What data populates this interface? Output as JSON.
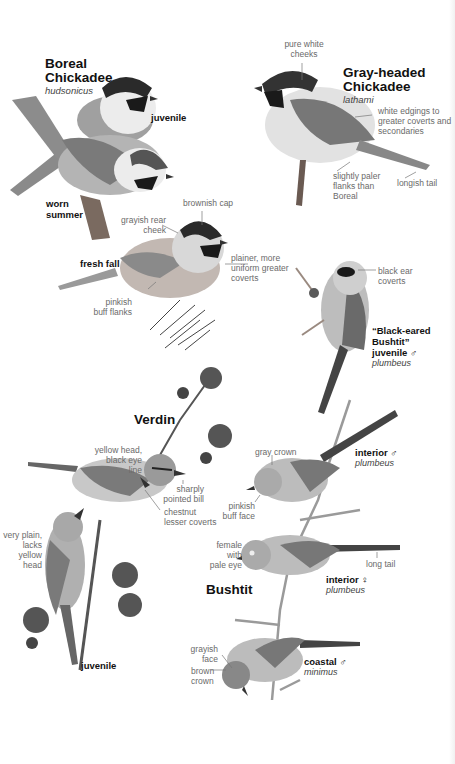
{
  "species": [
    {
      "name": "Boreal Chickadee",
      "name_line1": "Boreal",
      "name_line2": "Chickadee",
      "subspecies": "hudsonicus",
      "forms": {
        "juvenile": "juvenile",
        "worn_summer_1": "worn",
        "worn_summer_2": "summer",
        "fresh_fall": "fresh fall"
      },
      "annotations": {
        "brownish_cap": "brownish cap",
        "grayish_rear_cheek_1": "grayish rear",
        "grayish_rear_cheek_2": "cheek",
        "plainer_1": "plainer, more",
        "plainer_2": "uniform greater",
        "plainer_3": "coverts",
        "pinkish_1": "pinkish",
        "pinkish_2": "buff flanks"
      }
    },
    {
      "name": "Gray-headed Chickadee",
      "name_line1": "Gray-headed",
      "name_line2": "Chickadee",
      "subspecies": "lathami",
      "annotations": {
        "pure_white_1": "pure white",
        "pure_white_2": "cheeks",
        "white_edgings_1": "white edgings to",
        "white_edgings_2": "greater coverts and",
        "white_edgings_3": "secondaries",
        "paler_flanks_1": "slightly paler",
        "paler_flanks_2": "flanks than",
        "paler_flanks_3": "Boreal",
        "longish_tail": "longish tail"
      }
    },
    {
      "name": "Verdin",
      "forms": {
        "juvenile": "juvenile"
      },
      "annotations": {
        "yellow_head_1": "yellow head,",
        "yellow_head_2": "black eye line",
        "pointed_bill_1": "sharply",
        "pointed_bill_2": "pointed bill",
        "chestnut_1": "chestnut",
        "chestnut_2": "lesser coverts",
        "very_plain_1": "very plain,",
        "very_plain_2": "lacks yellow",
        "very_plain_3": "head"
      }
    },
    {
      "name": "Bushtit",
      "forms": {
        "black_eared_1": "“Black-eared",
        "black_eared_2": "Bushtit”",
        "black_eared_3": "juvenile ♂",
        "black_eared_sub": "plumbeus",
        "interior_male": "interior ♂",
        "interior_male_sub": "plumbeus",
        "interior_female": "interior ♀",
        "interior_female_sub": "plumbeus",
        "coastal_male": "coastal ♂",
        "coastal_male_sub": "minimus"
      },
      "annotations": {
        "black_ear_1": "black ear",
        "black_ear_2": "coverts",
        "gray_crown": "gray crown",
        "pinkish_face_1": "pinkish",
        "pinkish_face_2": "buff face",
        "female_eye_1": "female with",
        "female_eye_2": "pale eye",
        "long_tail": "long tail",
        "grayish_face_1": "grayish",
        "grayish_face_2": "face",
        "brown_crown_1": "brown",
        "brown_crown_2": "crown"
      }
    }
  ],
  "colors": {
    "cap_black": "#1e1e1e",
    "bird_gray": "#9a9a9a",
    "belly_light": "#e6e6e6",
    "label_gray": "#6a6a6a",
    "title_black": "#111111"
  }
}
